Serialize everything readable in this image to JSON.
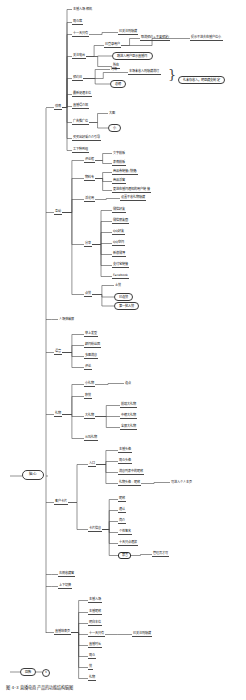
{
  "document": {
    "type": "mind-map",
    "title": "直播电商产品功能结构脑图",
    "root": {
      "label": "脑心",
      "x": 22,
      "y": 470
    },
    "caption": "图 4-3  直播电商产品的功能结构脑图",
    "legend": {
      "node_label": "回款",
      "badge_label": "6",
      "x": 10,
      "y": 668
    },
    "colors": {
      "line": "#4a4a4a",
      "text": "#111111",
      "background": "#ffffff",
      "pill_border": "#3c3c3c"
    }
  },
  "branches": [
    {
      "label": "详情",
      "x": 54,
      "y": 105,
      "children": [
        {
          "label": "主播入场·相机",
          "x": 72,
          "y": 8,
          "style": "plain"
        },
        {
          "label": "观众席",
          "x": 72,
          "y": 20,
          "style": "under"
        },
        {
          "label": "十一天只有",
          "x": 72,
          "y": 32,
          "style": "under",
          "children": [
            {
              "label": "已关注则隐藏",
              "x": 118,
              "y": 30,
              "style": "under"
            }
          ]
        },
        {
          "label": "关注电台",
          "x": 72,
          "y": 54,
          "style": "under",
          "children": [
            {
              "label": "已登录用户",
              "x": 104,
              "y": 43,
              "style": "under",
              "children": [
                {
                  "label": "取消预约+不要预定/",
                  "x": 140,
                  "y": 36,
                  "style": "under"
                },
                {
                  "label": "提示不进去在播户位小",
                  "x": 190,
                  "y": 36,
                  "style": "under"
                }
              ]
            },
            {
              "label": "跳进入用户显示直播间",
              "x": 112,
              "y": 52,
              "style": "pill"
            },
            {
              "label": "所在",
              "x": 112,
              "y": 64,
              "style": "under"
            }
          ]
        },
        {
          "label": "预约日",
          "x": 72,
          "y": 76,
          "style": "under",
          "children": [
            {
              "label": "时场",
              "x": 110,
              "y": 68,
              "style": "plain"
            },
            {
              "label": "本场未收入则隐藏消灯",
              "x": 128,
              "y": 70,
              "style": "under"
            },
            {
              "label": "总榜",
              "x": 110,
              "y": 80,
              "style": "pill"
            }
          ]
        },
        {
          "label": "最新促通本位",
          "x": 72,
          "y": 92,
          "style": "under"
        },
        {
          "label": "直播得介绍",
          "x": 72,
          "y": 104,
          "style": "under"
        },
        {
          "label": "广告推广位",
          "x": 72,
          "y": 120,
          "style": "under",
          "children": [
            {
              "label": "大图",
              "x": 108,
              "y": 112,
              "style": "plain"
            },
            {
              "label": "小",
              "x": 108,
              "y": 124,
              "style": "pill"
            }
          ]
        },
        {
          "label": "买买出好采介介引导",
          "x": 72,
          "y": 136,
          "style": "under"
        },
        {
          "label": "工下种到组",
          "x": 72,
          "y": 148,
          "style": "under"
        }
      ]
    },
    {
      "label": "互动",
      "x": 54,
      "y": 210,
      "children": [
        {
          "label": "评论框",
          "x": 84,
          "y": 158,
          "style": "under",
          "children": [
            {
              "label": "文字模板",
              "x": 112,
              "y": 152,
              "style": "plain"
            },
            {
              "label": "表情模板",
              "x": 112,
              "y": 161,
              "style": "under"
            }
          ]
        },
        {
          "label": "物料专",
          "x": 84,
          "y": 176,
          "style": "under",
          "children": [
            {
              "label": "商品券链接(快捷)",
              "x": 112,
              "y": 170,
              "style": "under"
            },
            {
              "label": "商品浮窗",
              "x": 112,
              "y": 179,
              "style": "under"
            },
            {
              "label": "更进在播间通知的用户链接",
              "x": 112,
              "y": 188,
              "style": "under"
            }
          ]
        },
        {
          "label": "活化用",
          "x": 84,
          "y": 197,
          "style": "under",
          "children": [
            {
              "label": "设置不收礼物隐藏",
              "x": 120,
              "y": 196,
              "style": "under"
            }
          ]
        },
        {
          "label": "分享",
          "x": 84,
          "y": 242,
          "children": [
            {
              "label": "微信好友",
              "x": 112,
              "y": 208,
              "style": "under"
            },
            {
              "label": "微信朋友圈",
              "x": 112,
              "y": 219,
              "style": "under"
            },
            {
              "label": "QQ好友",
              "x": 112,
              "y": 230,
              "style": "under"
            },
            {
              "label": "QQ空间",
              "x": 112,
              "y": 241,
              "style": "under"
            },
            {
              "label": "新浪微博",
              "x": 112,
              "y": 252,
              "style": "under"
            },
            {
              "label": "支付宝链接",
              "x": 112,
              "y": 263,
              "style": "under"
            },
            {
              "label": "Facebook",
              "x": 112,
              "y": 274,
              "style": "under"
            }
          ]
        },
        {
          "label": "点赞",
          "x": 84,
          "y": 292,
          "children": [
            {
              "label": "土赞",
              "x": 114,
              "y": 284,
              "style": "plain"
            },
            {
              "label": "已连赞",
              "x": 114,
              "y": 293,
              "style": "pill"
            },
            {
              "label": "第一批人赞",
              "x": 114,
              "y": 302,
              "style": "pill"
            }
          ]
        }
      ]
    },
    {
      "label": "人场弹幕屏",
      "x": 58,
      "y": 318,
      "style": "plain"
    },
    {
      "label": "语音",
      "x": 54,
      "y": 350,
      "children": [
        {
          "label": "举上发型",
          "x": 84,
          "y": 332,
          "style": "under"
        },
        {
          "label": "颜间粉丝团",
          "x": 84,
          "y": 343,
          "style": "under"
        },
        {
          "label": "多图消息",
          "x": 84,
          "y": 354,
          "style": "under"
        },
        {
          "label": "评论",
          "x": 84,
          "y": 365,
          "style": "under"
        }
      ]
    },
    {
      "label": "礼物",
      "x": 54,
      "y": 412,
      "children": [
        {
          "label": "小礼物",
          "x": 84,
          "y": 382,
          "style": "under",
          "children": [
            {
              "label": "连点",
              "x": 124,
              "y": 382,
              "style": "plain"
            }
          ]
        },
        {
          "label": "积赞",
          "x": 84,
          "y": 394,
          "style": "under"
        },
        {
          "label": "大礼物",
          "x": 84,
          "y": 414,
          "style": "under",
          "children": [
            {
              "label": "前端大礼物",
              "x": 120,
              "y": 403,
              "style": "under"
            },
            {
              "label": "中榜大礼物",
              "x": 120,
              "y": 414,
              "style": "under"
            },
            {
              "label": "全屏大礼物",
              "x": 120,
              "y": 425,
              "style": "under"
            }
          ]
        },
        {
          "label": "从叫礼物",
          "x": 84,
          "y": 436,
          "style": "under"
        }
      ]
    },
    {
      "label": "客户卡片",
      "x": 54,
      "y": 500,
      "children": [
        {
          "label": "入口",
          "x": 88,
          "y": 462,
          "children": [
            {
              "label": "主播头像",
              "x": 118,
              "y": 448,
              "style": "under"
            },
            {
              "label": "观众头像",
              "x": 118,
              "y": 459,
              "style": "under"
            },
            {
              "label": "消息列表中的昵称",
              "x": 118,
              "y": 470,
              "style": "under"
            },
            {
              "label": "礼物头像 · 昵称",
              "x": 118,
              "y": 481,
              "style": "under",
              "children": [
                {
                  "label": "可进入个人主页",
                  "x": 170,
                  "y": 481,
                  "style": "plain"
                }
              ]
            }
          ]
        },
        {
          "label": "卡片信息",
          "x": 88,
          "y": 527,
          "children": [
            {
              "label": "昵称",
              "x": 118,
              "y": 497,
              "style": "under"
            },
            {
              "label": "通认",
              "x": 118,
              "y": 508,
              "style": "under"
            },
            {
              "label": "简介",
              "x": 118,
              "y": 519,
              "style": "under"
            },
            {
              "label": "个性签名",
              "x": 118,
              "y": 530,
              "style": "under"
            },
            {
              "label": "十天只点通报",
              "x": 118,
              "y": 541,
              "style": "under"
            },
            {
              "label": "禁言",
              "x": 118,
              "y": 552,
              "style": "selected",
              "children": [
                {
                  "label": "管理员才可",
                  "x": 152,
                  "y": 552,
                  "style": "under"
                }
              ]
            }
          ]
        }
      ]
    },
    {
      "label": "右侧收藏窗",
      "x": 58,
      "y": 572,
      "style": "under"
    },
    {
      "label": "上下切换",
      "x": 58,
      "y": 584,
      "style": "under"
    },
    {
      "label": "直播结束页",
      "x": 54,
      "y": 630,
      "children": [
        {
          "label": "主播入场",
          "x": 88,
          "y": 598,
          "style": "under"
        },
        {
          "label": "主播昵称",
          "x": 88,
          "y": 610,
          "style": "under"
        },
        {
          "label": "明白本位",
          "x": 88,
          "y": 621,
          "style": "under"
        },
        {
          "label": "十一天只有",
          "x": 88,
          "y": 632,
          "style": "under",
          "children": [
            {
              "label": "已关注则隐藏",
              "x": 132,
              "y": 632,
              "style": "under"
            }
          ]
        },
        {
          "label": "直播时长",
          "x": 88,
          "y": 643,
          "style": "under"
        },
        {
          "label": "观众",
          "x": 88,
          "y": 654,
          "style": "under"
        },
        {
          "label": "赞",
          "x": 88,
          "y": 665,
          "style": "under"
        },
        {
          "label": "礼物",
          "x": 88,
          "y": 676,
          "style": "under"
        }
      ]
    }
  ],
  "callouts": [
    {
      "label": "礼未存收入，明显藏支制定",
      "x": 178,
      "y": 76,
      "style": "pill"
    }
  ]
}
